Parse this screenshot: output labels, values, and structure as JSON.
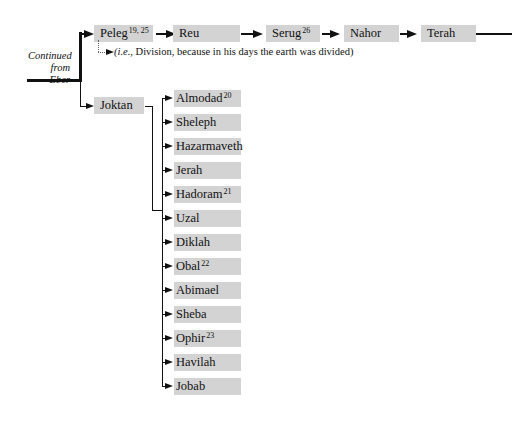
{
  "diagram": {
    "continued_label": "Continued from Eber",
    "main_line": [
      {
        "name": "Peleg",
        "sup": "19, 25"
      },
      {
        "name": "Reu",
        "sup": ""
      },
      {
        "name": "Serug",
        "sup": "26"
      },
      {
        "name": "Nahor",
        "sup": ""
      },
      {
        "name": "Terah",
        "sup": ""
      }
    ],
    "peleg_note_prefix": "(i.e.",
    "peleg_note_rest": ", Division, because in his days the earth was divided)",
    "joktan": {
      "name": "Joktan"
    },
    "joktan_sons": [
      {
        "name": "Almodad",
        "sup": "20"
      },
      {
        "name": "Sheleph",
        "sup": ""
      },
      {
        "name": "Hazarmaveth",
        "sup": ""
      },
      {
        "name": "Jerah",
        "sup": ""
      },
      {
        "name": "Hadoram",
        "sup": "21"
      },
      {
        "name": "Uzal",
        "sup": ""
      },
      {
        "name": "Diklah",
        "sup": ""
      },
      {
        "name": "Obal",
        "sup": "22"
      },
      {
        "name": "Abimael",
        "sup": ""
      },
      {
        "name": "Sheba",
        "sup": ""
      },
      {
        "name": "Ophir",
        "sup": "23"
      },
      {
        "name": "Havilah",
        "sup": ""
      },
      {
        "name": "Jobab",
        "sup": ""
      }
    ]
  },
  "colors": {
    "box_fill": "#d3d3d3",
    "line": "#111111"
  }
}
